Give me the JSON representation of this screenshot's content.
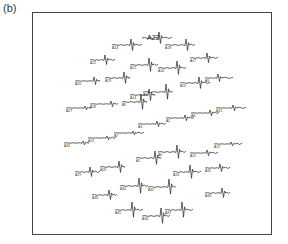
{
  "figure": {
    "panel_label": "(b)",
    "highlighted_electrode": "A23",
    "frame": {
      "x": 32,
      "y": 12,
      "width": 240,
      "height": 223
    },
    "trace_color": "#222222",
    "traces": [
      {
        "x": 112,
        "y": 45,
        "len": 30,
        "spike": 18,
        "amp": 6,
        "label": "A24"
      },
      {
        "x": 142,
        "y": 38,
        "len": 30,
        "spike": 16,
        "amp": 6,
        "label": "A23",
        "big": true
      },
      {
        "x": 165,
        "y": 45,
        "len": 30,
        "spike": 20,
        "amp": 6,
        "label": "A18"
      },
      {
        "x": 90,
        "y": 60,
        "len": 25,
        "spike": 14,
        "amp": 5,
        "label": "A22"
      },
      {
        "x": 130,
        "y": 65,
        "len": 28,
        "spike": 18,
        "amp": 7,
        "label": "A21"
      },
      {
        "x": 158,
        "y": 68,
        "len": 28,
        "spike": 18,
        "amp": 7,
        "label": "A16"
      },
      {
        "x": 190,
        "y": 58,
        "len": 28,
        "spike": 16,
        "amp": 5,
        "label": "A17"
      },
      {
        "x": 75,
        "y": 81,
        "len": 25,
        "spike": 18,
        "amp": 4,
        "label": "A20"
      },
      {
        "x": 105,
        "y": 78,
        "len": 25,
        "spike": 18,
        "amp": 6,
        "label": "A19"
      },
      {
        "x": 130,
        "y": 95,
        "len": 25,
        "spike": 18,
        "amp": 6,
        "label": "A14"
      },
      {
        "x": 180,
        "y": 83,
        "len": 30,
        "spike": 18,
        "amp": 6,
        "label": "A10"
      },
      {
        "x": 205,
        "y": 78,
        "len": 28,
        "spike": 12,
        "amp": 4,
        "label": "A9"
      },
      {
        "x": 66,
        "y": 108,
        "len": 25,
        "spike": 18,
        "amp": 2,
        "label": "A27"
      },
      {
        "x": 90,
        "y": 104,
        "len": 28,
        "spike": 20,
        "amp": 3,
        "label": "A26"
      },
      {
        "x": 122,
        "y": 102,
        "len": 25,
        "spike": 18,
        "amp": 8,
        "label": "A5"
      },
      {
        "x": 143,
        "y": 92,
        "len": 30,
        "spike": 22,
        "amp": 8,
        "label": "A4"
      },
      {
        "x": 138,
        "y": 124,
        "len": 28,
        "spike": 18,
        "amp": 3,
        "label": "A3"
      },
      {
        "x": 166,
        "y": 118,
        "len": 28,
        "spike": 18,
        "amp": 3,
        "label": "A2"
      },
      {
        "x": 191,
        "y": 113,
        "len": 28,
        "spike": 18,
        "amp": 3,
        "label": "A8"
      },
      {
        "x": 216,
        "y": 108,
        "len": 30,
        "spike": 16,
        "amp": 3,
        "label": "A15"
      },
      {
        "x": 64,
        "y": 143,
        "len": 25,
        "spike": 18,
        "amp": 2,
        "label": "A26"
      },
      {
        "x": 88,
        "y": 138,
        "len": 28,
        "spike": 18,
        "amp": 2,
        "label": "A25"
      },
      {
        "x": 114,
        "y": 133,
        "len": 30,
        "spike": 18,
        "amp": 2,
        "label": "A7"
      },
      {
        "x": 136,
        "y": 158,
        "len": 25,
        "spike": 18,
        "amp": 7,
        "label": "A1"
      },
      {
        "x": 158,
        "y": 152,
        "len": 28,
        "spike": 18,
        "amp": 7,
        "label": "A6"
      },
      {
        "x": 190,
        "y": 153,
        "len": 28,
        "spike": 16,
        "amp": 3,
        "label": "A11"
      },
      {
        "x": 214,
        "y": 144,
        "len": 28,
        "spike": 16,
        "amp": 2,
        "label": "A12"
      },
      {
        "x": 75,
        "y": 172,
        "len": 25,
        "spike": 14,
        "amp": 5,
        "label": "A29"
      },
      {
        "x": 100,
        "y": 167,
        "len": 25,
        "spike": 18,
        "amp": 6,
        "label": "A28"
      },
      {
        "x": 173,
        "y": 172,
        "len": 28,
        "spike": 16,
        "amp": 7,
        "label": "A13"
      },
      {
        "x": 205,
        "y": 168,
        "len": 25,
        "spike": 14,
        "amp": 4,
        "label": "A31"
      },
      {
        "x": 120,
        "y": 186,
        "len": 28,
        "spike": 18,
        "amp": 8,
        "label": "A30"
      },
      {
        "x": 148,
        "y": 187,
        "len": 28,
        "spike": 20,
        "amp": 8,
        "label": "A32"
      },
      {
        "x": 92,
        "y": 195,
        "len": 25,
        "spike": 16,
        "amp": 5,
        "label": "A36"
      },
      {
        "x": 205,
        "y": 193,
        "len": 25,
        "spike": 16,
        "amp": 5,
        "label": "A33"
      },
      {
        "x": 115,
        "y": 210,
        "len": 28,
        "spike": 16,
        "amp": 8,
        "label": "A35"
      },
      {
        "x": 142,
        "y": 216,
        "len": 28,
        "spike": 18,
        "amp": 8,
        "label": "A34"
      },
      {
        "x": 165,
        "y": 210,
        "len": 28,
        "spike": 16,
        "amp": 8,
        "label": "A37"
      }
    ]
  }
}
